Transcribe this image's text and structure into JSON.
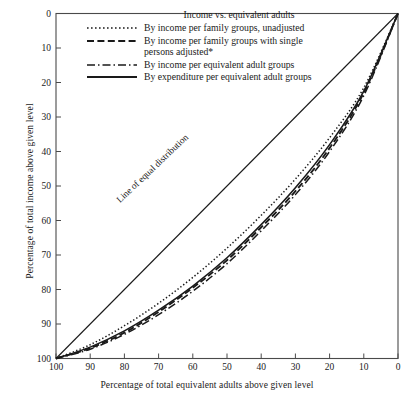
{
  "chart_data": {
    "type": "line",
    "title": "Income vs. equivalent adults",
    "xlabel": "Percentage of total equivalent adults above given level",
    "ylabel": "Percentage of total income above given level",
    "xlim": [
      100,
      0
    ],
    "ylim": [
      100,
      0
    ],
    "x_axis_reversed": true,
    "y_axis_reversed": true,
    "grid": false,
    "legend_position": "top-center",
    "xticks": [
      100,
      90,
      80,
      70,
      60,
      50,
      40,
      30,
      20,
      10,
      0
    ],
    "yticks": [
      0,
      10,
      20,
      30,
      40,
      50,
      60,
      70,
      80,
      90,
      100
    ],
    "annotations": [
      {
        "text": "Line of equal distribution",
        "rotation": -43.5
      }
    ],
    "reference_line": {
      "name": "Line of equal distribution",
      "style": "solid",
      "x": [
        100,
        0
      ],
      "y": [
        100,
        0
      ]
    },
    "x": [
      100,
      90,
      80,
      70,
      60,
      50,
      40,
      30,
      20,
      10,
      0
    ],
    "series": [
      {
        "name": "By income per family groups, unadjusted",
        "style": "dotted",
        "values": [
          100,
          96.0,
          90.5,
          84.0,
          76.5,
          68.0,
          58.5,
          48.0,
          36.0,
          21.5,
          0
        ]
      },
      {
        "name": "By income per family groups with single\npersons adjusted*",
        "style": "dashed",
        "values": [
          100,
          97.0,
          92.5,
          86.5,
          79.5,
          71.5,
          62.0,
          51.5,
          39.0,
          23.0,
          0
        ]
      },
      {
        "name": "By income per equivalent adult groups",
        "style": "dashdot",
        "values": [
          100,
          97.3,
          93.0,
          87.3,
          80.5,
          72.5,
          63.0,
          52.5,
          40.0,
          23.8,
          0
        ]
      },
      {
        "name": "By expenditure per equivalent adult groups",
        "style": "solid",
        "values": [
          100,
          96.7,
          92.0,
          86.0,
          79.0,
          70.8,
          61.2,
          50.5,
          38.0,
          22.5,
          0
        ]
      }
    ]
  },
  "legend": {
    "title": "Income vs. equivalent adults",
    "items": [
      {
        "label": "By income per family groups, unadjusted",
        "style": "dotted"
      },
      {
        "label": "By income per family groups with single\npersons adjusted*",
        "style": "dashed"
      },
      {
        "label": "By income per equivalent adult groups",
        "style": "dashdot"
      },
      {
        "label": "By expenditure per equivalent adult groups",
        "style": "solid"
      }
    ]
  },
  "annotation": {
    "equal_distribution": "Line of equal distribution"
  },
  "axes": {
    "x_title": "Percentage of total equivalent adults above given level",
    "y_title": "Percentage of total income above given level",
    "x_tick_labels": [
      "100",
      "90",
      "80",
      "70",
      "60",
      "50",
      "40",
      "30",
      "20",
      "10",
      "0"
    ],
    "y_tick_labels": [
      "0",
      "10",
      "20",
      "30",
      "40",
      "50",
      "60",
      "70",
      "80",
      "90",
      "100"
    ]
  },
  "colors": {
    "line": "#1a1a1a",
    "axis": "#555555",
    "background": "#ffffff"
  }
}
